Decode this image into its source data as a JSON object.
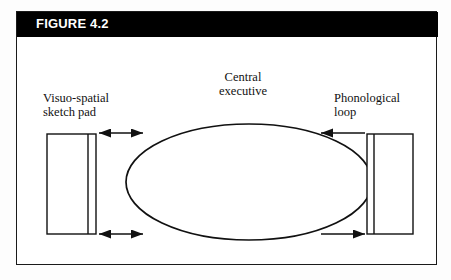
{
  "figure": {
    "title": "FIGURE 4.2",
    "title_bar_color": "#000000",
    "title_text_color": "#ffffff",
    "frame_color": "#1a1a1a",
    "background_color": "#ffffff"
  },
  "diagram": {
    "type": "working-memory-model",
    "center": {
      "label": "Central\nexecutive",
      "shape": "ellipse"
    },
    "left_component": {
      "label": "Visuo-spatial\nsketch pad",
      "shape": "divided-rectangle"
    },
    "right_component": {
      "label": "Phonological\nloop",
      "shape": "divided-rectangle"
    },
    "connectors": [
      {
        "name": "left-top-connector",
        "direction": "bidirectional"
      },
      {
        "name": "left-bottom-connector",
        "direction": "bidirectional"
      },
      {
        "name": "right-top-connector",
        "direction": "left"
      },
      {
        "name": "right-bottom-connector",
        "direction": "right"
      }
    ],
    "stroke_color": "#111111"
  }
}
